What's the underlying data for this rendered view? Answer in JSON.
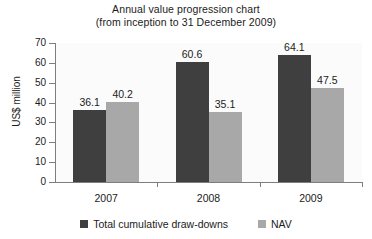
{
  "chart_data": {
    "type": "bar",
    "title": "Annual value progression chart (from inception to 31 December 2009)",
    "title_line1": "Annual value progression chart",
    "title_line2": "(from inception to 31 December 2009)",
    "xlabel": "",
    "ylabel": "US$ million",
    "categories": [
      "2007",
      "2008",
      "2009"
    ],
    "series": [
      {
        "name": "Total cumulative draw-downs",
        "color": "#3f3f3f",
        "values": [
          36.1,
          40.2,
          0
        ]
      }
    ],
    "ylim": [
      0,
      70
    ],
    "ytick_labels": [
      "0",
      "10",
      "20",
      "30",
      "40",
      "50",
      "60",
      "70"
    ],
    "ytick_values": [
      0,
      10,
      20,
      30,
      40,
      50,
      60,
      70
    ],
    "grid": false,
    "legend_position": "bottom"
  },
  "chart": {
    "title_line1": "Annual value progression chart",
    "title_line2": "(from inception to 31 December 2009)",
    "ylabel": "US$ million",
    "ymin": 0,
    "ymax": 70,
    "yticks": [
      {
        "label": "70",
        "value": 70
      },
      {
        "label": "60",
        "value": 60
      },
      {
        "label": "50",
        "value": 50
      },
      {
        "label": "40",
        "value": 40
      },
      {
        "label": "30",
        "value": 30
      },
      {
        "label": "20",
        "value": 20
      },
      {
        "label": "10",
        "value": 10
      },
      {
        "label": "0",
        "value": 0
      }
    ],
    "categories": [
      {
        "label": "2007",
        "bars": [
          {
            "series": "Total cumulative draw-downs",
            "value": 36.1,
            "label": "36.1",
            "color": "#3f3f3f"
          },
          {
            "series": "NAV",
            "value": 40.2,
            "label": "40.2",
            "color": "#a8a8a8"
          }
        ]
      },
      {
        "label": "2008",
        "bars": [
          {
            "series": "Total cumulative draw-downs",
            "value": 60.6,
            "label": "60.6",
            "color": "#3f3f3f"
          },
          {
            "series": "NAV",
            "value": 35.1,
            "label": "35.1",
            "color": "#a8a8a8"
          }
        ]
      },
      {
        "label": "2009",
        "bars": [
          {
            "series": "Total cumulative draw-downs",
            "value": 64.1,
            "label": "64.1",
            "color": "#3f3f3f"
          },
          {
            "series": "NAV",
            "value": 47.5,
            "label": "47.5",
            "color": "#a8a8a8"
          }
        ]
      }
    ],
    "legend": [
      {
        "label": "Total cumulative draw-downs",
        "color": "#3f3f3f"
      },
      {
        "label": "NAV",
        "color": "#a8a8a8"
      }
    ],
    "colors": {
      "series_dark": "#3f3f3f",
      "series_light": "#a8a8a8",
      "axis": "#7e7e7e",
      "text": "#1b1b1b",
      "plot_background": "#fbfbfb"
    }
  }
}
